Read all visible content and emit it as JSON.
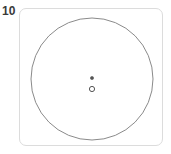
{
  "panel": {
    "index_label": "10",
    "background_color": "#ffffff",
    "border_color": "#dcdcdc",
    "corner_radius": 7
  },
  "figure": {
    "title": "",
    "shapes": [
      {
        "name": "outer-circle",
        "type": "circle",
        "cx": 91,
        "cy": 78,
        "r": 61,
        "stroke": "#8a8a8a",
        "stroke_width": 1,
        "fill": "none"
      },
      {
        "name": "center-dot",
        "type": "dot",
        "cx": 91,
        "cy": 77,
        "r": 1.6,
        "stroke": "#555555",
        "fill": "#555555"
      },
      {
        "name": "center-ring",
        "type": "ring",
        "cx": 91,
        "cy": 88,
        "r": 2.6,
        "stroke": "#555555",
        "stroke_width": 1,
        "fill": "none"
      }
    ]
  }
}
